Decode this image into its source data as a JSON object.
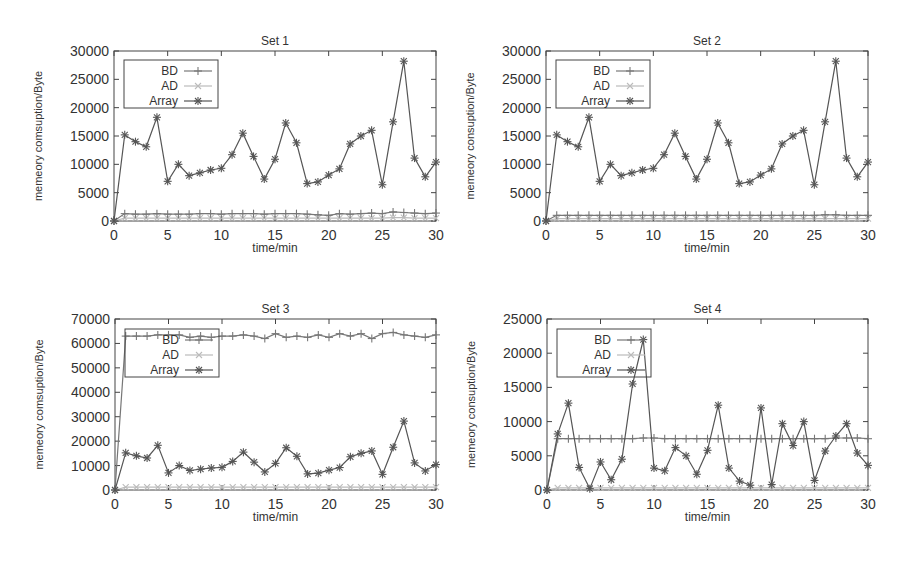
{
  "figure": {
    "layout": "2x2 grid",
    "colors": {
      "axis": "#444444",
      "BD": "#777777",
      "AD": "#bbbbbb",
      "Array": "#555555",
      "text": "#333333"
    }
  },
  "chart_data": [
    {
      "type": "line",
      "title": "Set 1",
      "xlabel": "time/min",
      "ylabel": "memeory comsuption/Byte",
      "xlim": [
        0,
        30
      ],
      "ylim": [
        0,
        30000
      ],
      "xticks": [
        0,
        5,
        10,
        15,
        20,
        25,
        30
      ],
      "yticks": [
        0,
        5000,
        10000,
        15000,
        20000,
        25000,
        30000
      ],
      "grid": false,
      "legend_position": "top-left",
      "x": [
        0,
        1,
        2,
        3,
        4,
        5,
        6,
        7,
        8,
        9,
        10,
        11,
        12,
        13,
        14,
        15,
        16,
        17,
        18,
        19,
        20,
        21,
        22,
        23,
        24,
        25,
        26,
        27,
        28,
        29,
        30
      ],
      "series": [
        {
          "name": "BD",
          "marker": "+",
          "values": [
            0,
            1300,
            1200,
            1200,
            1300,
            1200,
            1200,
            1200,
            1300,
            1300,
            1200,
            1300,
            1300,
            1300,
            1200,
            1300,
            1300,
            1300,
            1200,
            1100,
            1000,
            1300,
            1200,
            1300,
            1400,
            1300,
            1600,
            1500,
            1400,
            1300,
            1400
          ]
        },
        {
          "name": "AD",
          "marker": "x",
          "values": [
            0,
            500,
            500,
            500,
            500,
            500,
            500,
            500,
            500,
            500,
            500,
            500,
            500,
            500,
            500,
            500,
            500,
            500,
            500,
            500,
            500,
            500,
            500,
            500,
            500,
            500,
            600,
            600,
            500,
            500,
            500
          ]
        },
        {
          "name": "Array",
          "marker": "*",
          "values": [
            0,
            15200,
            14000,
            13100,
            18300,
            7000,
            10000,
            8000,
            8500,
            9000,
            9300,
            11700,
            15500,
            11400,
            7400,
            10900,
            17300,
            13800,
            6600,
            6900,
            8100,
            9200,
            13600,
            15000,
            16000,
            6400,
            17500,
            28200,
            11100,
            7800,
            10400
          ]
        }
      ]
    },
    {
      "type": "line",
      "title": "Set 2",
      "xlabel": "time/min",
      "ylabel": "memeory consuption/Byte",
      "xlim": [
        0,
        30
      ],
      "ylim": [
        0,
        30000
      ],
      "xticks": [
        0,
        5,
        10,
        15,
        20,
        25,
        30
      ],
      "yticks": [
        0,
        5000,
        10000,
        15000,
        20000,
        25000,
        30000
      ],
      "grid": false,
      "legend_position": "top-left",
      "x": [
        0,
        1,
        2,
        3,
        4,
        5,
        6,
        7,
        8,
        9,
        10,
        11,
        12,
        13,
        14,
        15,
        16,
        17,
        18,
        19,
        20,
        21,
        22,
        23,
        24,
        25,
        26,
        27,
        28,
        29,
        30
      ],
      "series": [
        {
          "name": "BD",
          "marker": "+",
          "values": [
            0,
            1000,
            1000,
            1000,
            1000,
            1000,
            1000,
            1000,
            1000,
            1000,
            1000,
            1000,
            1000,
            1000,
            1000,
            1000,
            1000,
            1000,
            1000,
            1000,
            1000,
            1000,
            1000,
            1000,
            1000,
            1000,
            1100,
            1100,
            1000,
            1000,
            1000
          ]
        },
        {
          "name": "AD",
          "marker": "x",
          "values": [
            0,
            400,
            400,
            400,
            400,
            400,
            400,
            400,
            400,
            400,
            400,
            400,
            400,
            400,
            400,
            400,
            400,
            400,
            400,
            400,
            400,
            400,
            400,
            400,
            400,
            400,
            400,
            400,
            400,
            400,
            400
          ]
        },
        {
          "name": "Array",
          "marker": "*",
          "values": [
            0,
            15200,
            14000,
            13100,
            18300,
            7000,
            10000,
            8000,
            8500,
            9000,
            9300,
            11700,
            15500,
            11400,
            7400,
            10900,
            17300,
            13800,
            6600,
            6900,
            8100,
            9200,
            13600,
            15000,
            16000,
            6400,
            17500,
            28200,
            11100,
            7800,
            10400
          ]
        }
      ]
    },
    {
      "type": "line",
      "title": "Set 3",
      "xlabel": "time/min",
      "ylabel": "memeory comsuption/Byte",
      "xlim": [
        0,
        30
      ],
      "ylim": [
        0,
        70000
      ],
      "xticks": [
        0,
        5,
        10,
        15,
        20,
        25,
        30
      ],
      "yticks": [
        0,
        10000,
        20000,
        30000,
        40000,
        50000,
        60000,
        70000
      ],
      "grid": false,
      "legend_position": "top-left",
      "x": [
        0,
        1,
        2,
        3,
        4,
        5,
        6,
        7,
        8,
        9,
        10,
        11,
        12,
        13,
        14,
        15,
        16,
        17,
        18,
        19,
        20,
        21,
        22,
        23,
        24,
        25,
        26,
        27,
        28,
        29,
        30
      ],
      "series": [
        {
          "name": "BD",
          "marker": "+",
          "values": [
            0,
            63000,
            63000,
            63000,
            63500,
            63500,
            63500,
            62500,
            63000,
            62500,
            63000,
            63000,
            63500,
            63000,
            62000,
            64000,
            62500,
            63000,
            62500,
            63500,
            62500,
            64000,
            63000,
            64000,
            62000,
            64000,
            64500,
            63500,
            63000,
            62500,
            63500
          ]
        },
        {
          "name": "AD",
          "marker": "x",
          "values": [
            0,
            1200,
            1200,
            1200,
            1200,
            1200,
            1200,
            1200,
            1200,
            1200,
            1200,
            1200,
            1200,
            1200,
            1200,
            1200,
            1200,
            1200,
            1200,
            1200,
            1200,
            1200,
            1200,
            1200,
            1200,
            1200,
            1200,
            1200,
            1200,
            1200,
            1200
          ]
        },
        {
          "name": "Array",
          "marker": "*",
          "values": [
            0,
            15200,
            14000,
            13100,
            18300,
            7000,
            10000,
            8000,
            8500,
            9000,
            9300,
            11700,
            15500,
            11400,
            7400,
            10900,
            17300,
            13800,
            6600,
            6900,
            8100,
            9200,
            13600,
            15000,
            16000,
            6400,
            17500,
            28200,
            11100,
            7800,
            10400
          ]
        }
      ]
    },
    {
      "type": "line",
      "title": "Set 4",
      "xlabel": "time/min",
      "ylabel": "memeory consuption/Byte",
      "xlim": [
        0,
        30
      ],
      "ylim": [
        0,
        25000
      ],
      "xticks": [
        0,
        5,
        10,
        15,
        20,
        25,
        30
      ],
      "yticks": [
        0,
        5000,
        10000,
        15000,
        20000,
        25000
      ],
      "grid": false,
      "legend_position": "top-left",
      "x": [
        0,
        1,
        2,
        3,
        4,
        5,
        6,
        7,
        8,
        9,
        10,
        11,
        12,
        13,
        14,
        15,
        16,
        17,
        18,
        19,
        20,
        21,
        22,
        23,
        24,
        25,
        26,
        27,
        28,
        29,
        30
      ],
      "series": [
        {
          "name": "BD",
          "marker": "+",
          "values": [
            0,
            7500,
            7500,
            7500,
            7500,
            7500,
            7500,
            7500,
            7500,
            7600,
            7600,
            7500,
            7500,
            7500,
            7500,
            7500,
            7500,
            7500,
            7500,
            7500,
            7500,
            7500,
            7500,
            7500,
            7500,
            7500,
            7500,
            7600,
            7600,
            7600,
            7500
          ]
        },
        {
          "name": "AD",
          "marker": "x",
          "values": [
            0,
            300,
            300,
            300,
            300,
            300,
            300,
            300,
            300,
            300,
            300,
            300,
            300,
            300,
            300,
            300,
            300,
            300,
            300,
            300,
            300,
            300,
            300,
            300,
            300,
            300,
            300,
            300,
            300,
            300,
            300
          ]
        },
        {
          "name": "Array",
          "marker": "*",
          "values": [
            0,
            8200,
            12700,
            3300,
            200,
            4100,
            1500,
            4500,
            15500,
            22000,
            3200,
            2800,
            6200,
            5000,
            2300,
            5800,
            12400,
            3200,
            1300,
            700,
            12000,
            800,
            9700,
            6500,
            10000,
            1400,
            5700,
            7900,
            9700,
            5400,
            3600
          ]
        }
      ]
    }
  ],
  "panels": [
    {
      "id": "set-1",
      "left": 114,
      "top": 51,
      "right": 436,
      "bottom": 221,
      "legend": {
        "x": 124,
        "y": 60,
        "w": 94,
        "h": 48
      }
    },
    {
      "id": "set-2",
      "left": 546,
      "top": 51,
      "right": 868,
      "bottom": 221,
      "legend": {
        "x": 556,
        "y": 60,
        "w": 94,
        "h": 48
      }
    },
    {
      "id": "set-3",
      "left": 115,
      "top": 319,
      "right": 436,
      "bottom": 490,
      "legend": {
        "x": 125,
        "y": 329,
        "w": 94,
        "h": 48
      }
    },
    {
      "id": "set-4",
      "left": 547,
      "top": 319,
      "right": 868,
      "bottom": 490,
      "legend": {
        "x": 557,
        "y": 329,
        "w": 94,
        "h": 48
      }
    }
  ]
}
